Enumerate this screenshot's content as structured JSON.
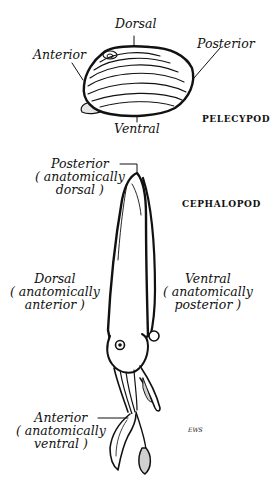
{
  "pelecypod": {
    "title": "PELECYPOD",
    "labels": {
      "dorsal": "Dorsal",
      "anterior": "Anterior",
      "posterior": "Posterior",
      "ventral": "Ventral"
    }
  },
  "cephalopod": {
    "title": "CEPHALOPOD",
    "labels": {
      "posterior": {
        "main": "Posterior",
        "line1": "( anatomically",
        "line2": "dorsal )"
      },
      "dorsal": {
        "main": "Dorsal",
        "line1": "( anatomically",
        "line2": "anterior )"
      },
      "ventral": {
        "main": "Ventral",
        "line1": "( anatomically",
        "line2": "posterior )"
      },
      "anterior": {
        "main": "Anterior",
        "line1": "( anatomically",
        "line2": "ventral )"
      }
    }
  },
  "signature": "EWS",
  "colors": {
    "ink": "#111111",
    "background": "#ffffff"
  }
}
